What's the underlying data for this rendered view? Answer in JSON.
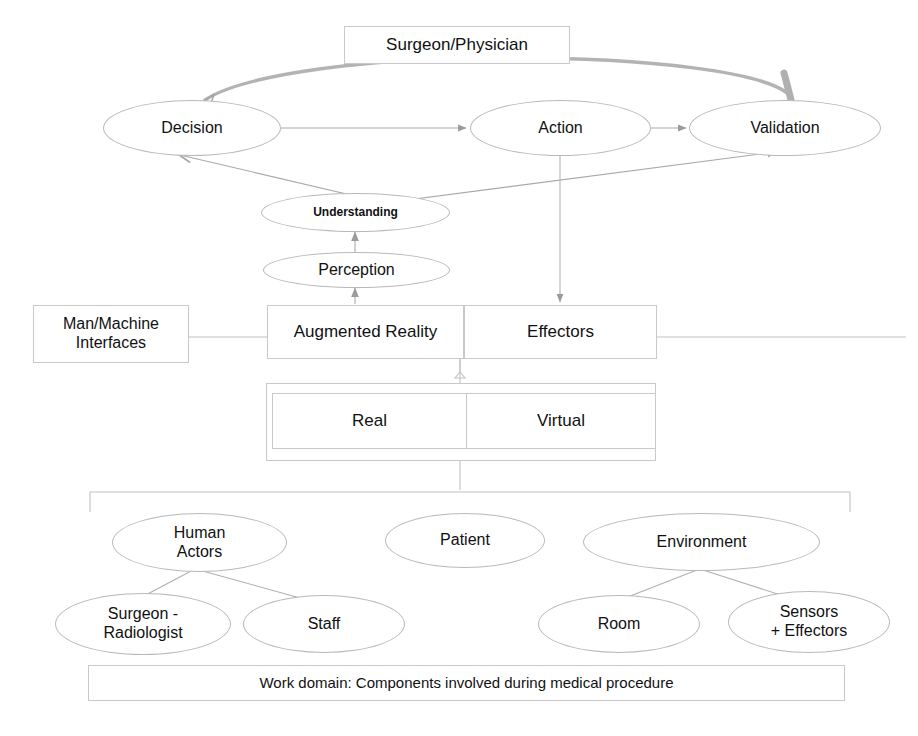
{
  "diagram": {
    "colors": {
      "node_stroke": "#c9c9c9",
      "ellipse_stroke": "#b9b9b9",
      "edge_thin": "#9b9b9b",
      "edge_thick": "#a6a6a6",
      "text": "#111111",
      "background": "#ffffff"
    }
  },
  "nodes": {
    "surgeon_physician": {
      "label": "Surgeon/Physician",
      "shape": "box"
    },
    "decision": {
      "label": "Decision",
      "shape": "ellipse"
    },
    "action": {
      "label": "Action",
      "shape": "ellipse"
    },
    "validation": {
      "label": "Validation",
      "shape": "ellipse"
    },
    "understanding": {
      "label": "Understanding",
      "shape": "ellipse"
    },
    "perception": {
      "label": "Perception",
      "shape": "ellipse"
    },
    "man_machine_interfaces": {
      "label": "Man/Machine\nInterfaces",
      "line1": "Man/Machine",
      "line2": "Interfaces",
      "shape": "box"
    },
    "augmented_reality": {
      "label": "Augmented Reality",
      "shape": "box"
    },
    "effectors": {
      "label": "Effectors",
      "shape": "box"
    },
    "real": {
      "label": "Real",
      "shape": "box"
    },
    "virtual": {
      "label": "Virtual",
      "shape": "box"
    },
    "human_actors": {
      "line1": "Human",
      "line2": "Actors",
      "label": "Human Actors",
      "shape": "ellipse"
    },
    "patient": {
      "label": "Patient",
      "shape": "ellipse"
    },
    "environment": {
      "label": "Environment",
      "shape": "ellipse"
    },
    "surgeon_radiologist": {
      "line1": "Surgeon -",
      "line2": "Radiologist",
      "label": "Surgeon - Radiologist",
      "shape": "ellipse"
    },
    "staff": {
      "label": "Staff",
      "shape": "ellipse"
    },
    "room": {
      "label": "Room",
      "shape": "ellipse"
    },
    "sensors_effectors": {
      "line1": "Sensors",
      "line2": "+ Effectors",
      "label": "Sensors + Effectors",
      "shape": "ellipse"
    },
    "work_domain": {
      "label": "Work domain: Components involved during medical procedure",
      "shape": "box"
    }
  },
  "edges": [
    {
      "from": "decision",
      "to": "action",
      "style": "thin-arrow"
    },
    {
      "from": "action",
      "to": "validation",
      "style": "thin-arrow"
    },
    {
      "from": "validation",
      "to": "decision",
      "style": "thick-curved-arrow"
    },
    {
      "from": "understanding",
      "to": "decision",
      "style": "thin-arrow"
    },
    {
      "from": "understanding",
      "to": "validation",
      "style": "thin-arrow"
    },
    {
      "from": "perception",
      "to": "understanding",
      "style": "thin-arrow-up"
    },
    {
      "from": "augmented_reality",
      "to": "perception",
      "style": "thin-arrow-up"
    },
    {
      "from": "action",
      "to": "effectors",
      "style": "thin-arrow-down"
    },
    {
      "from": "man_machine_interfaces",
      "to": "augmented_reality",
      "style": "plain-line"
    },
    {
      "from": "effectors",
      "to": "right-margin",
      "style": "plain-line"
    },
    {
      "from": "augmented_reality",
      "to": "real_virtual_group",
      "style": "brace"
    },
    {
      "from": "real_virtual_group",
      "to": "work_domain_group",
      "style": "brace"
    },
    {
      "from": "human_actors",
      "to": "surgeon_radiologist",
      "style": "plain-line"
    },
    {
      "from": "human_actors",
      "to": "staff",
      "style": "plain-line"
    },
    {
      "from": "environment",
      "to": "room",
      "style": "plain-line"
    },
    {
      "from": "environment",
      "to": "sensors_effectors",
      "style": "plain-line"
    }
  ]
}
